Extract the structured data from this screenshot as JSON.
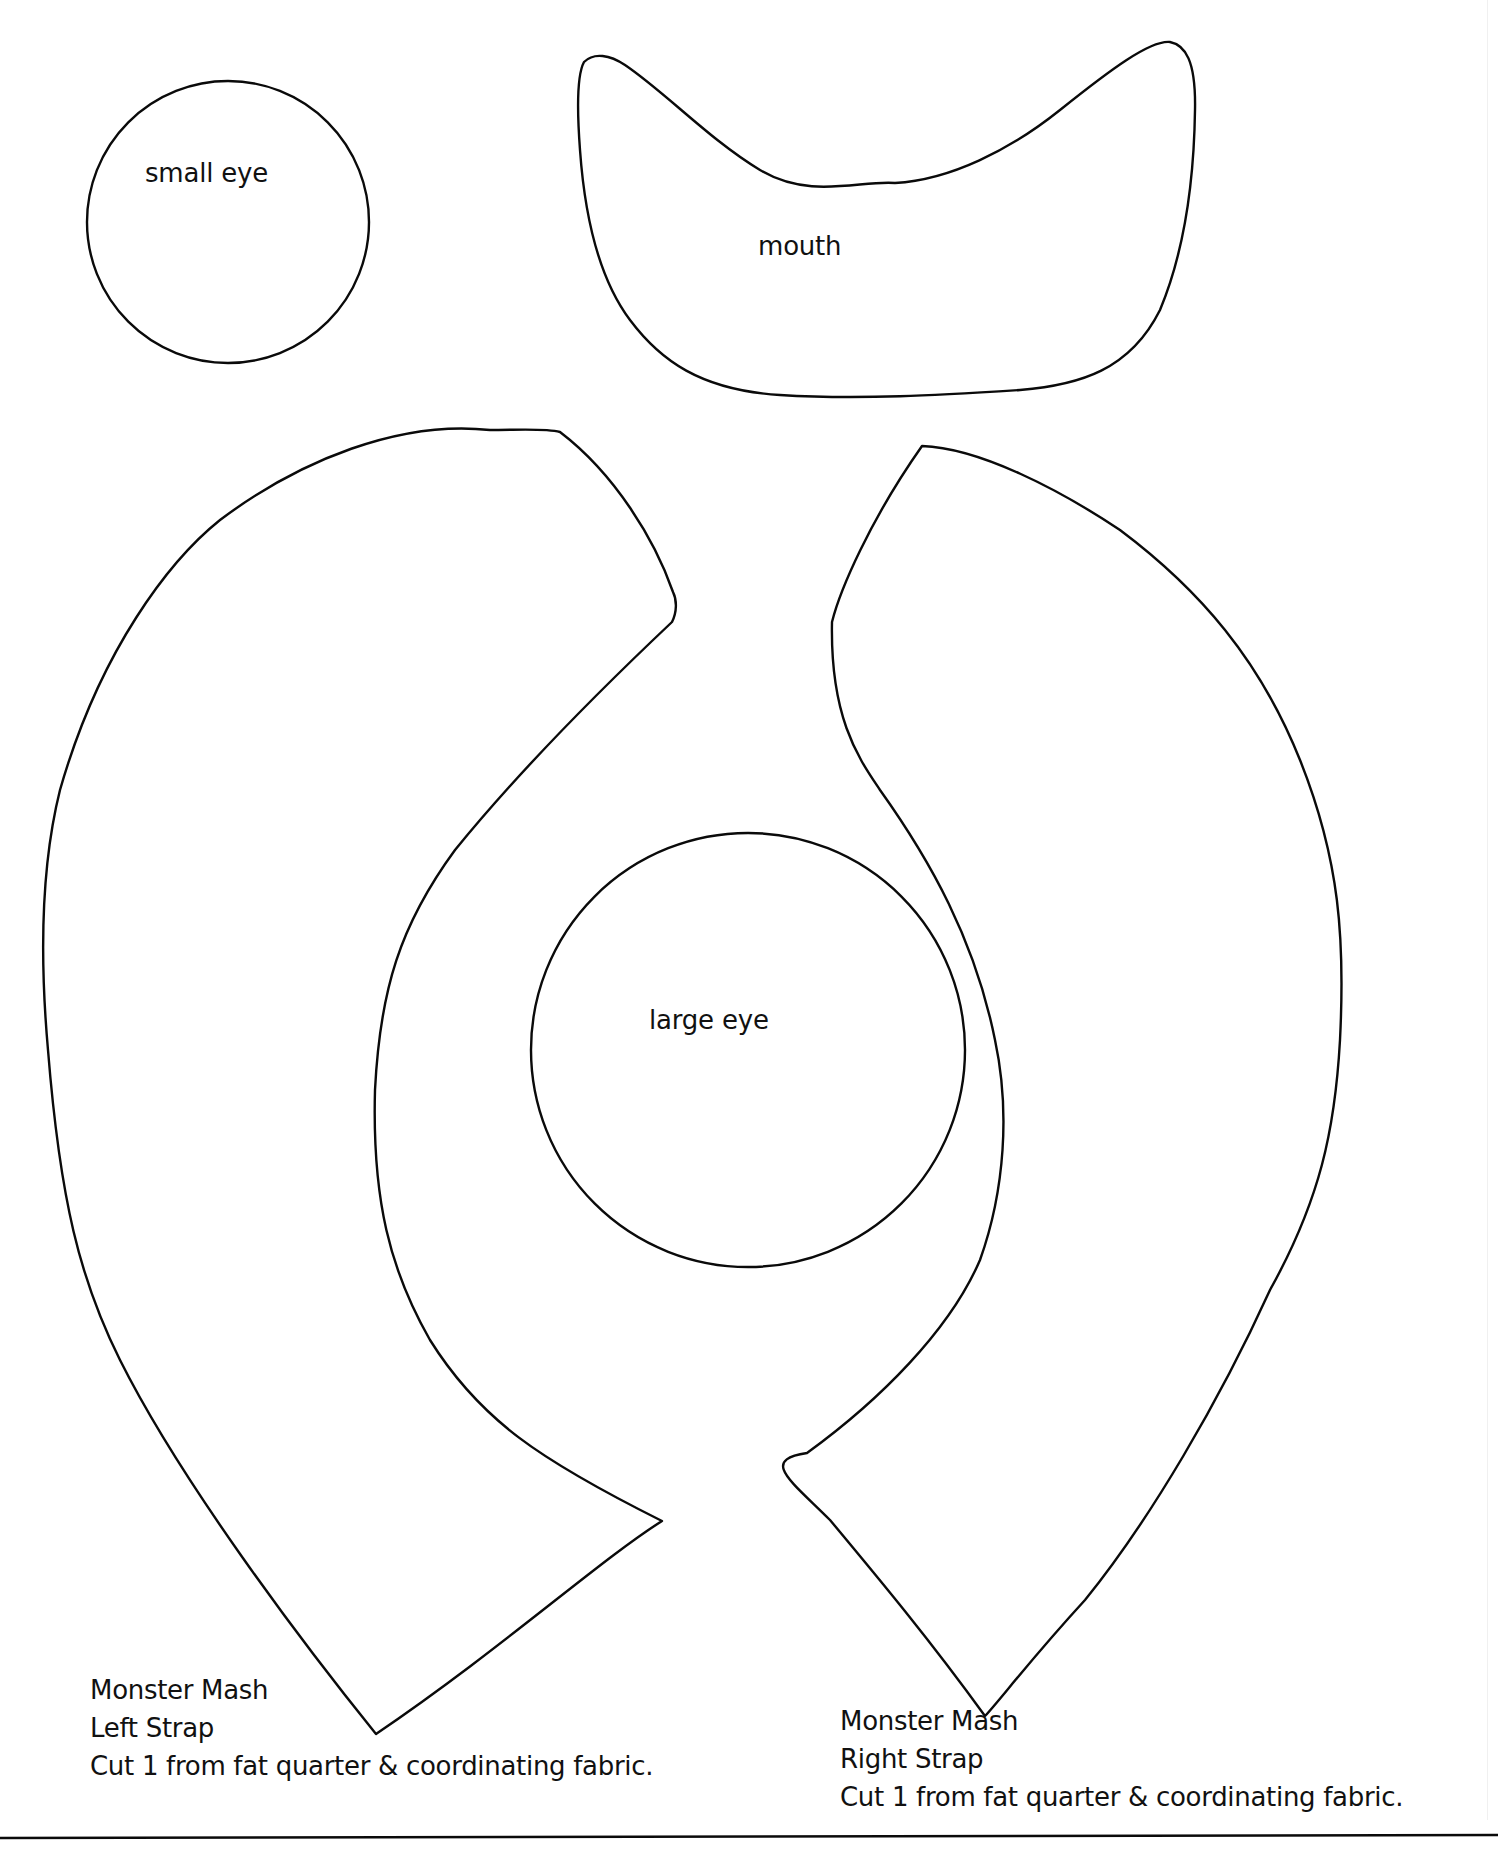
{
  "document": {
    "type": "sewing pattern template",
    "line_color": "#0a0a0a",
    "background_color": "#ffffff"
  },
  "pieces": {
    "small_eye": {
      "label": "small eye"
    },
    "mouth": {
      "label": "mouth"
    },
    "large_eye": {
      "label": "large eye"
    },
    "left_strap": {
      "caption": [
        "Monster Mash",
        "Left Strap",
        "Cut 1 from fat quarter & coordinating fabric."
      ]
    },
    "right_strap": {
      "caption": [
        "Monster Mash",
        "Right Strap",
        "Cut 1 from fat quarter & coordinating fabric."
      ]
    }
  }
}
